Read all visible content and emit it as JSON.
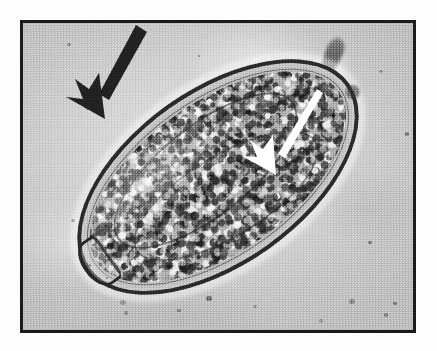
{
  "figure": {
    "kind": "light-microscopy-photomicrograph",
    "caption": "",
    "plate": {
      "border_color": "#1b1b1b",
      "border_width_px": 3,
      "paper_color": "#fdfdfd",
      "field_color": "#c9c9c9",
      "margin_px": 20,
      "width_px": 396,
      "height_px": 313
    }
  },
  "specimen": {
    "label": "ovum",
    "shape": "ellipsoid",
    "long_axis_px": 322,
    "short_axis_px": 176,
    "rotation_deg": -35.5,
    "shell_color": "#1e1e1e",
    "interior_color": "#a8a8a8",
    "features": [
      {
        "name": "operculum",
        "position": "upper-left pole"
      },
      {
        "name": "egg-shell",
        "position": "perimeter"
      },
      {
        "name": "miracidium",
        "position": "interior"
      },
      {
        "name": "abopercular-knob",
        "position": "lower-right pole"
      }
    ]
  },
  "annotations": [
    {
      "id": "black-arrow",
      "color": "#141414",
      "points_to": "operculum",
      "tail": {
        "x": 137,
        "y": 20
      },
      "tip": {
        "x": 102,
        "y": 98
      }
    },
    {
      "id": "white-arrow",
      "color": "#ffffff",
      "points_to": "egg-shell",
      "tail": {
        "x": 312,
        "y": 88
      },
      "tip": {
        "x": 273,
        "y": 168
      }
    }
  ],
  "debris": {
    "fiber_label": "dark elongated artifact",
    "vacuole_label": "small refractile bubble",
    "specks": [
      {
        "x": 120,
        "y": 300,
        "r": 3.0
      },
      {
        "x": 123,
        "y": 310,
        "r": 2.2
      },
      {
        "x": 176,
        "y": 308,
        "r": 1.8
      },
      {
        "x": 206,
        "y": 296,
        "r": 2.6
      },
      {
        "x": 252,
        "y": 304,
        "r": 1.6
      },
      {
        "x": 349,
        "y": 299,
        "r": 3.0
      },
      {
        "x": 383,
        "y": 312,
        "r": 2.0
      },
      {
        "x": 392,
        "y": 301,
        "r": 1.6
      },
      {
        "x": 70,
        "y": 218,
        "r": 1.8
      },
      {
        "x": 86,
        "y": 263,
        "r": 1.6
      },
      {
        "x": 104,
        "y": 275,
        "r": 1.4
      },
      {
        "x": 404,
        "y": 131,
        "r": 2.4
      },
      {
        "x": 378,
        "y": 69,
        "r": 1.6
      },
      {
        "x": 66,
        "y": 42,
        "r": 1.8
      },
      {
        "x": 196,
        "y": 53,
        "r": 1.4
      },
      {
        "x": 367,
        "y": 240,
        "r": 1.8
      },
      {
        "x": 318,
        "y": 318,
        "r": 2.2
      }
    ]
  },
  "colors": {
    "background_field": "#c9c9c9",
    "frame": "#1b1b1b",
    "shell_dark": "#1e1e1e",
    "highlight": "#ffffff",
    "paper": "#fdfdfd"
  }
}
